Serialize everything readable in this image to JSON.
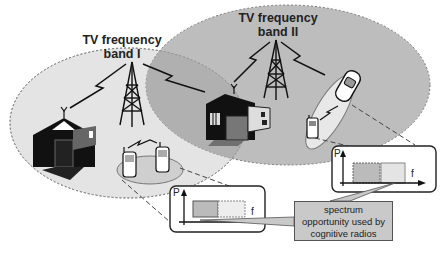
{
  "diagram": {
    "band1": {
      "title_line1": "TV frequency",
      "title_line2": "band I"
    },
    "band2": {
      "title_line1": "TV frequency",
      "title_line2": "band II"
    },
    "callout": {
      "line1": "spectrum",
      "line2": "opportunity used by",
      "line3": "cognitive radios"
    },
    "spectrum_plot_left": {
      "y_axis": "P",
      "x_axis": "f"
    },
    "spectrum_plot_right": {
      "y_axis": "P",
      "x_axis": "f"
    },
    "colors": {
      "band1_fill": "#e4e4e4",
      "band2_fill": "#bdbdbd",
      "overlap_fill": "#b0b0b0",
      "callout_fill": "#c9c9c9",
      "ink": "#111111"
    }
  }
}
